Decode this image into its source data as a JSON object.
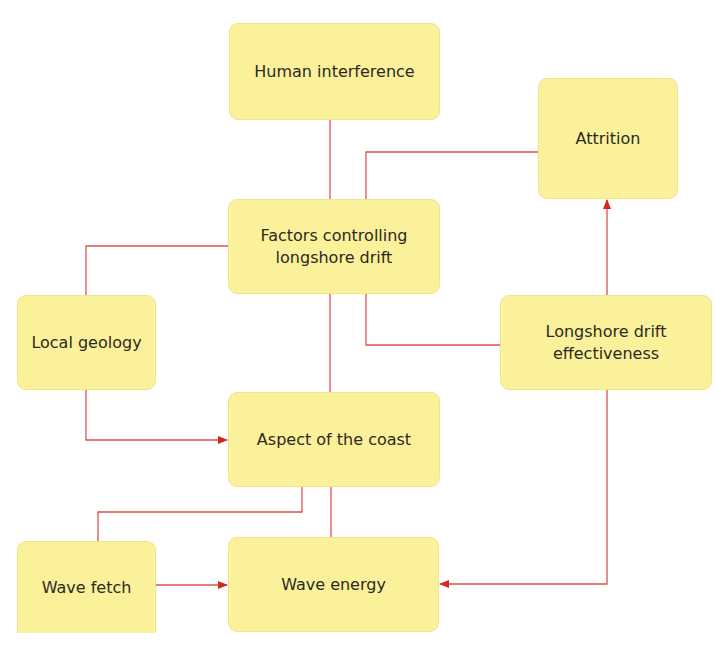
{
  "diagram": {
    "type": "flow-diagram",
    "colors": {
      "box_fill": "#fbf19a",
      "box_border": "#f3e48a",
      "line": "#d9534f",
      "arrowhead": "#d2291f",
      "text": "#2b2a22"
    },
    "nodes": {
      "human_interference": {
        "label": "Human interference"
      },
      "attrition": {
        "label": "Attrition"
      },
      "factors": {
        "label": "Factors controlling\nlongshore drift"
      },
      "local_geology": {
        "label": "Local geology"
      },
      "longshore_effectiveness": {
        "label": "Longshore drift\neffectiveness"
      },
      "aspect": {
        "label": "Aspect of the coast"
      },
      "wave_fetch": {
        "label": "Wave fetch"
      },
      "wave_energy": {
        "label": "Wave energy"
      }
    },
    "edges": [
      {
        "from": "Human interference",
        "to": "Factors controlling longshore drift",
        "arrow": false
      },
      {
        "from": "Factors controlling longshore drift",
        "to": "Attrition",
        "arrow": false
      },
      {
        "from": "Factors controlling longshore drift",
        "to": "Local geology",
        "arrow": false
      },
      {
        "from": "Factors controlling longshore drift",
        "to": "Longshore drift effectiveness",
        "arrow": false
      },
      {
        "from": "Factors controlling longshore drift",
        "to": "Aspect of the coast",
        "arrow": false
      },
      {
        "from": "Local geology",
        "to": "Aspect of the coast",
        "arrow": true
      },
      {
        "from": "Longshore drift effectiveness",
        "to": "Attrition",
        "arrow": true
      },
      {
        "from": "Aspect of the coast",
        "to": "Wave fetch",
        "arrow": false
      },
      {
        "from": "Aspect of the coast",
        "to": "Wave energy",
        "arrow": false
      },
      {
        "from": "Wave fetch",
        "to": "Wave energy",
        "arrow": true
      },
      {
        "from": "Longshore drift effectiveness",
        "to": "Wave energy",
        "arrow": true
      }
    ]
  }
}
